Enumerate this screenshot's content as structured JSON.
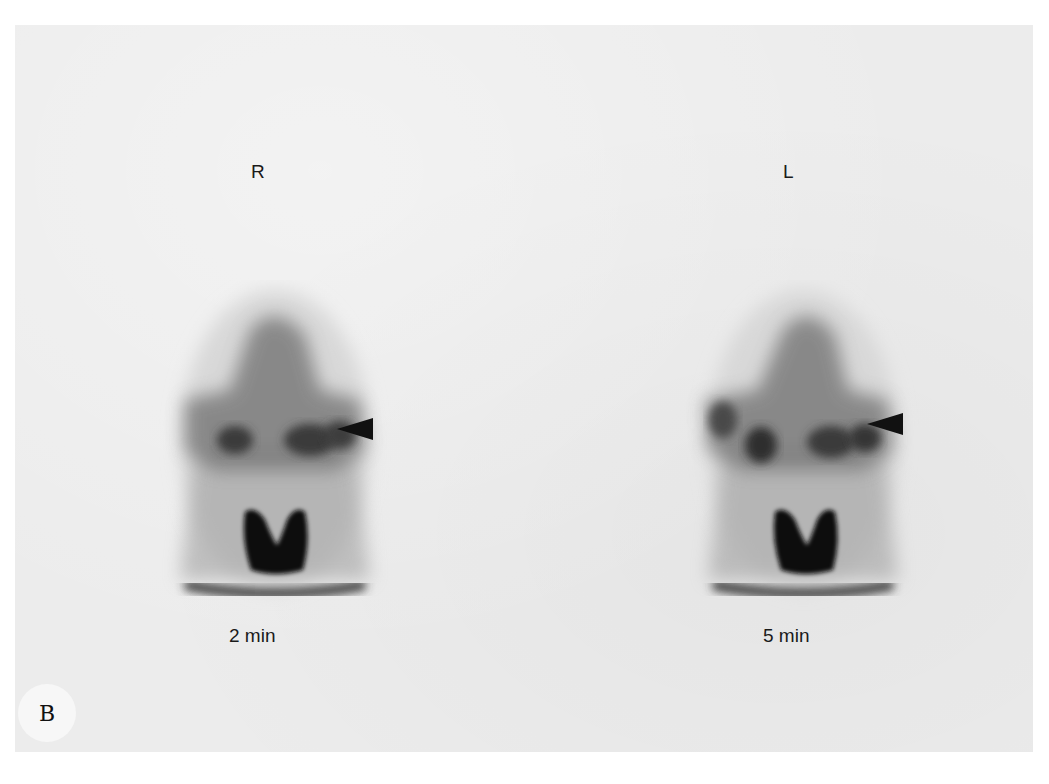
{
  "figure": {
    "panel_letter": "B",
    "background_color": "#ececec",
    "ink_color": "#111111",
    "views": [
      {
        "side_label": "R",
        "time_label": "2 min",
        "arrowhead": "arrow-pointing-left"
      },
      {
        "side_label": "L",
        "time_label": "5 min",
        "arrowhead": "arrow-pointing-left"
      }
    ]
  }
}
